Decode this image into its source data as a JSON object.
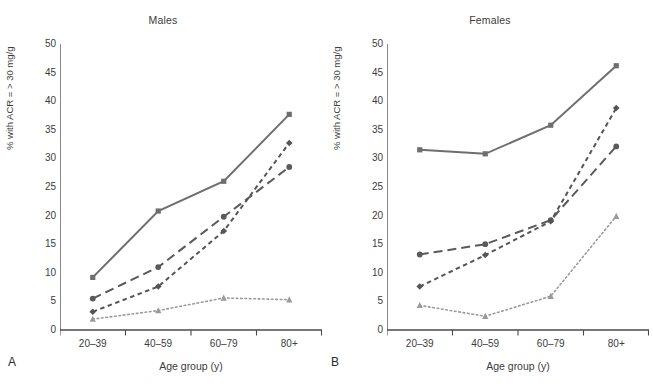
{
  "figure": {
    "width": 653,
    "height": 388,
    "background": "#ffffff"
  },
  "chart_data": [
    {
      "type": "line",
      "panel_letter": "A",
      "title": "Males",
      "xlabel": "Age group (y)",
      "ylabel": "% with ACR = > 30 mg/g",
      "categories": [
        "20–39",
        "40–59",
        "60–79",
        "80+"
      ],
      "ylim": [
        0,
        50
      ],
      "yticks": [
        0,
        5,
        10,
        15,
        20,
        25,
        30,
        35,
        40,
        45,
        50
      ],
      "ytick_labels": [
        "0",
        "5",
        "10",
        "15",
        "20",
        "25",
        "30",
        "35",
        "40",
        "45",
        "50"
      ],
      "grid": false,
      "legend": "none",
      "series": [
        {
          "name": "series-1",
          "values": [
            9.2,
            20.8,
            26.0,
            37.7
          ],
          "line_style": "solid",
          "marker": "square",
          "color": "#6e6e6e"
        },
        {
          "name": "series-2",
          "values": [
            5.5,
            11.0,
            19.8,
            28.5
          ],
          "line_style": "long-dash",
          "marker": "circle",
          "color": "#5a5a5a"
        },
        {
          "name": "series-3",
          "values": [
            3.2,
            7.6,
            17.3,
            32.7
          ],
          "line_style": "short-dash",
          "marker": "diamond",
          "color": "#555555"
        },
        {
          "name": "series-4",
          "values": [
            1.9,
            3.4,
            5.6,
            5.3
          ],
          "line_style": "dotted",
          "marker": "triangle",
          "color": "#9a9a9a"
        }
      ]
    },
    {
      "type": "line",
      "panel_letter": "B",
      "title": "Females",
      "xlabel": "Age group (y)",
      "ylabel": "% with ACR = > 30 mg/g",
      "categories": [
        "20–39",
        "40–59",
        "60–79",
        "80+"
      ],
      "ylim": [
        0,
        50
      ],
      "yticks": [
        0,
        5,
        10,
        15,
        20,
        25,
        30,
        35,
        40,
        45,
        50
      ],
      "ytick_labels": [
        "0",
        "5",
        "10",
        "15",
        "20",
        "25",
        "30",
        "35",
        "40",
        "45",
        "50"
      ],
      "grid": false,
      "legend": "none",
      "series": [
        {
          "name": "series-1",
          "values": [
            31.5,
            30.8,
            35.8,
            46.2
          ],
          "line_style": "solid",
          "marker": "square",
          "color": "#6e6e6e"
        },
        {
          "name": "series-2",
          "values": [
            13.2,
            15.0,
            19.2,
            32.1
          ],
          "line_style": "long-dash",
          "marker": "circle",
          "color": "#5a5a5a"
        },
        {
          "name": "series-3",
          "values": [
            7.6,
            13.1,
            19.0,
            38.8
          ],
          "line_style": "short-dash",
          "marker": "diamond",
          "color": "#555555"
        },
        {
          "name": "series-4",
          "values": [
            4.3,
            2.4,
            5.9,
            19.9
          ],
          "line_style": "dotted",
          "marker": "triangle",
          "color": "#9a9a9a"
        }
      ]
    }
  ]
}
